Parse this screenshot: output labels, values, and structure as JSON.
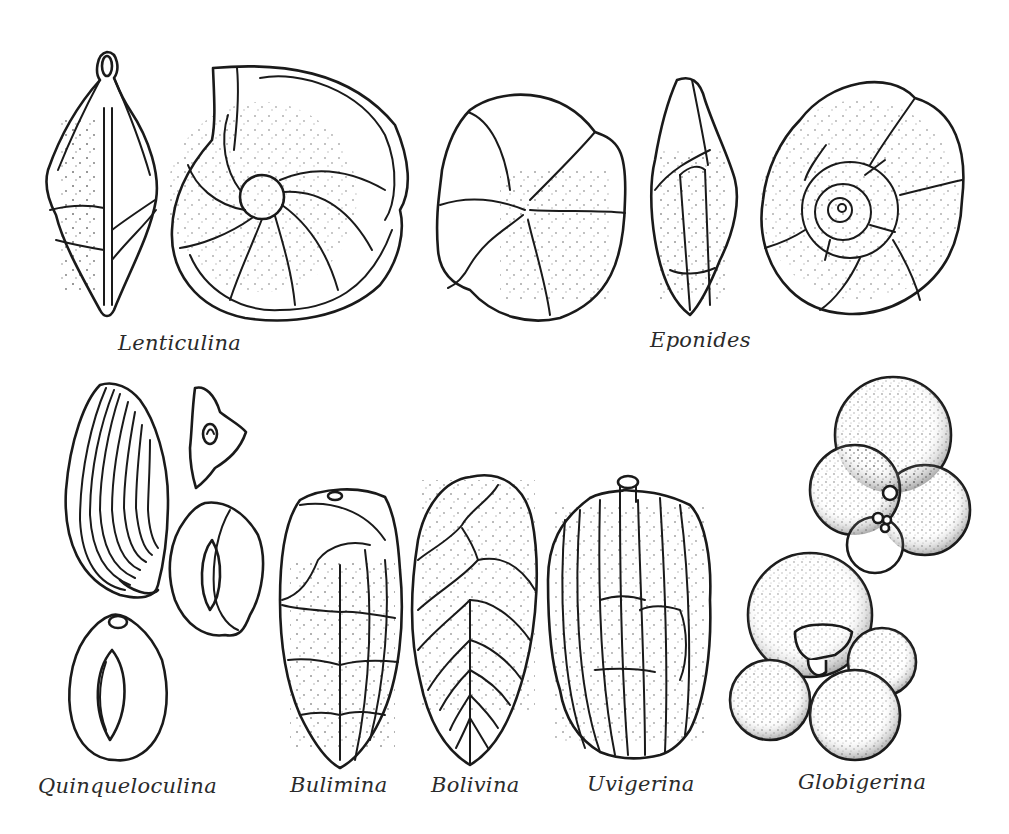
{
  "figure": {
    "header_fragment": "",
    "colors": {
      "ink": "#1a1a1a",
      "background": "#ffffff",
      "label": "#2a2a2a"
    },
    "specimens": [
      {
        "genus": "Lenticulina",
        "views": [
          "edge-view",
          "side-view"
        ]
      },
      {
        "genus": "Eponides",
        "views": [
          "umbilical-view",
          "edge-view",
          "spiral-view"
        ]
      },
      {
        "genus": "Quinqueloculina",
        "views": [
          "costate-test",
          "apertural-view",
          "side-view-a",
          "side-view-b"
        ]
      },
      {
        "genus": "Bulimina",
        "views": [
          "side-view"
        ]
      },
      {
        "genus": "Bolivina",
        "views": [
          "side-view"
        ]
      },
      {
        "genus": "Uvigerina",
        "views": [
          "side-view"
        ]
      },
      {
        "genus": "Globigerina",
        "views": [
          "spiral-view",
          "umbilical-view"
        ]
      }
    ],
    "labels": {
      "lenticulina": "Lenticulina",
      "eponides": "Eponides",
      "quinqueloculina": "Quinqueloculina",
      "bulimina": "Bulimina",
      "bolivina": "Bolivina",
      "uvigerina": "Uvigerina",
      "globigerina": "Globigerina"
    }
  }
}
